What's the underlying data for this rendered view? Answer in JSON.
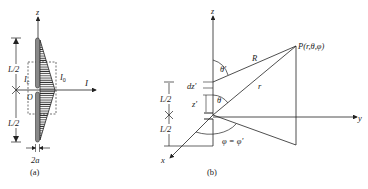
{
  "panel_a": {
    "caption": "(a)",
    "axis_z": "z",
    "axis_i": "I",
    "half_length_top": "L/2",
    "half_length_bottom": "L/2",
    "feed_current": "I",
    "feed_current_sub": "c",
    "peak_current": "I",
    "peak_current_sub": "0",
    "origin": "O",
    "diameter": "2a"
  },
  "panel_b": {
    "caption": "(b)",
    "axis_z": "z",
    "axis_y": "y",
    "axis_x": "x",
    "point": "P(r,θ,φ)",
    "distance_R": "R",
    "distance_r": "r",
    "theta_prime": "θ'",
    "theta": "θ",
    "dz_prime": "dz'",
    "z_prime": "z'",
    "half_length_top": "L/2",
    "half_length_bottom": "L/2",
    "phi_eq": "φ = φ'"
  },
  "colors": {
    "line": "#222222",
    "hatch": "#333333",
    "dipole_fill": "#888888"
  }
}
